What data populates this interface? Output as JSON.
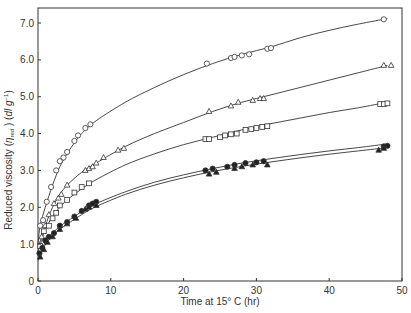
{
  "chart_data": {
    "type": "scatter",
    "title": "",
    "xlabel": "Time at 15° C (hr)",
    "ylabel": "Reduced viscosity (η red ) (dl g⁻¹)",
    "ylabel_parts": {
      "pre": "Reduced viscosity (",
      "eta": "η",
      "sub": "red",
      "post": " ) (",
      "unit": "dl g",
      "sup": "−1",
      "end": ")"
    },
    "xlim": [
      0,
      50
    ],
    "ylim": [
      0,
      7.4
    ],
    "x_ticks": [
      0,
      10,
      20,
      30,
      40,
      50
    ],
    "x_tick_labels": [
      "0",
      "10",
      "20",
      "30",
      "40",
      "50"
    ],
    "y_ticks": [
      0,
      1,
      2,
      3,
      4,
      5,
      6,
      7
    ],
    "y_tick_labels": [
      "0",
      "1.0",
      "2.0",
      "3.0",
      "4.0",
      "5.0",
      "6.0",
      "7.0"
    ],
    "grid": false,
    "legend": null,
    "series": [
      {
        "name": "open circles",
        "marker": "circle-open",
        "x": [
          0.3,
          0.7,
          1.2,
          1.8,
          2.5,
          3.0,
          3.5,
          4.0,
          5.0,
          5.5,
          6.5,
          7.2,
          23.2,
          26.5,
          27.0,
          28.0,
          29.0,
          31.5,
          32.0,
          47.5
        ],
        "y": [
          1.5,
          1.65,
          2.15,
          2.55,
          3.0,
          3.25,
          3.35,
          3.5,
          3.8,
          3.95,
          4.15,
          4.25,
          5.9,
          6.05,
          6.08,
          6.12,
          6.15,
          6.3,
          6.32,
          7.1
        ],
        "curve": [
          [
            0,
            1.0
          ],
          [
            0.3,
            1.5
          ],
          [
            1,
            2.0
          ],
          [
            2,
            2.6
          ],
          [
            3,
            3.1
          ],
          [
            4,
            3.45
          ],
          [
            5,
            3.75
          ],
          [
            6,
            4.0
          ],
          [
            8,
            4.35
          ],
          [
            12,
            4.85
          ],
          [
            16,
            5.25
          ],
          [
            20,
            5.6
          ],
          [
            24,
            5.9
          ],
          [
            28,
            6.15
          ],
          [
            32,
            6.35
          ],
          [
            36,
            6.6
          ],
          [
            40,
            6.8
          ],
          [
            44,
            6.97
          ],
          [
            48,
            7.12
          ]
        ]
      },
      {
        "name": "open triangles",
        "marker": "triangle-open",
        "x": [
          0.5,
          1.0,
          1.5,
          2.2,
          2.8,
          3.2,
          4.0,
          6.5,
          7.0,
          7.5,
          8.0,
          9.0,
          11.0,
          11.8,
          23.5,
          26.5,
          27.5,
          29.5,
          30.5,
          31.0,
          47.5,
          48.5
        ],
        "y": [
          1.2,
          1.5,
          1.8,
          2.1,
          2.25,
          2.35,
          2.6,
          3.0,
          3.05,
          3.1,
          3.2,
          3.35,
          3.55,
          3.6,
          4.6,
          4.75,
          4.85,
          4.9,
          4.95,
          4.95,
          5.85,
          5.85
        ],
        "curve": [
          [
            0,
            0.9
          ],
          [
            0.5,
            1.2
          ],
          [
            1,
            1.5
          ],
          [
            2,
            2.0
          ],
          [
            3,
            2.35
          ],
          [
            4,
            2.6
          ],
          [
            6,
            2.95
          ],
          [
            8,
            3.2
          ],
          [
            12,
            3.65
          ],
          [
            16,
            4.0
          ],
          [
            20,
            4.3
          ],
          [
            24,
            4.6
          ],
          [
            28,
            4.85
          ],
          [
            32,
            5.05
          ],
          [
            36,
            5.25
          ],
          [
            40,
            5.45
          ],
          [
            44,
            5.65
          ],
          [
            48,
            5.85
          ]
        ]
      },
      {
        "name": "open squares",
        "marker": "square-open",
        "x": [
          0.3,
          0.8,
          1.5,
          2.0,
          2.5,
          3.0,
          4.0,
          5.0,
          6.0,
          7.0,
          23.0,
          23.5,
          25.0,
          25.7,
          26.5,
          27.3,
          28.5,
          29.3,
          30.0,
          30.8,
          31.5,
          47.0,
          47.5,
          48.0
        ],
        "y": [
          0.95,
          1.35,
          1.5,
          1.7,
          1.85,
          2.05,
          2.2,
          2.4,
          2.55,
          2.65,
          3.85,
          3.85,
          3.9,
          3.95,
          3.98,
          4.0,
          4.1,
          4.12,
          4.15,
          4.18,
          4.2,
          4.8,
          4.8,
          4.82
        ],
        "curve": [
          [
            0,
            0.8
          ],
          [
            0.5,
            1.1
          ],
          [
            1,
            1.4
          ],
          [
            2,
            1.75
          ],
          [
            3,
            2.0
          ],
          [
            4,
            2.2
          ],
          [
            6,
            2.5
          ],
          [
            8,
            2.75
          ],
          [
            12,
            3.15
          ],
          [
            16,
            3.45
          ],
          [
            20,
            3.7
          ],
          [
            24,
            3.9
          ],
          [
            28,
            4.1
          ],
          [
            32,
            4.27
          ],
          [
            36,
            4.42
          ],
          [
            40,
            4.57
          ],
          [
            44,
            4.7
          ],
          [
            48,
            4.85
          ]
        ]
      },
      {
        "name": "filled circles",
        "marker": "circle-filled",
        "x": [
          0.2,
          0.6,
          1.0,
          1.5,
          2.2,
          3.0,
          4.0,
          5.0,
          6.0,
          7.0,
          7.5,
          8.0,
          23.0,
          24.0,
          26.0,
          27.0,
          28.5,
          30.0,
          31.0,
          47.5,
          48.0
        ],
        "y": [
          0.75,
          0.9,
          1.1,
          1.2,
          1.3,
          1.5,
          1.6,
          1.75,
          1.9,
          2.05,
          2.1,
          2.15,
          3.0,
          3.05,
          3.1,
          3.15,
          3.2,
          3.22,
          3.25,
          3.65,
          3.67
        ],
        "curve": [
          [
            0,
            0.6
          ],
          [
            0.5,
            0.85
          ],
          [
            1,
            1.05
          ],
          [
            2,
            1.3
          ],
          [
            3,
            1.48
          ],
          [
            4,
            1.62
          ],
          [
            6,
            1.88
          ],
          [
            8,
            2.1
          ],
          [
            12,
            2.42
          ],
          [
            16,
            2.68
          ],
          [
            20,
            2.88
          ],
          [
            24,
            3.05
          ],
          [
            28,
            3.2
          ],
          [
            32,
            3.32
          ],
          [
            36,
            3.43
          ],
          [
            40,
            3.53
          ],
          [
            44,
            3.62
          ],
          [
            48,
            3.72
          ]
        ]
      },
      {
        "name": "filled triangles",
        "marker": "triangle-filled",
        "x": [
          0.3,
          0.8,
          1.3,
          2.0,
          3.0,
          4.0,
          5.2,
          6.5,
          7.0,
          8.0,
          23.5,
          24.5,
          27.0,
          28.0,
          29.5,
          31.5,
          46.8,
          47.5
        ],
        "y": [
          0.65,
          0.85,
          1.05,
          1.2,
          1.4,
          1.55,
          1.7,
          1.95,
          2.0,
          2.05,
          2.9,
          2.95,
          3.05,
          3.1,
          3.15,
          3.15,
          3.55,
          3.6
        ],
        "curve": [
          [
            0,
            0.55
          ],
          [
            0.5,
            0.8
          ],
          [
            1,
            0.98
          ],
          [
            2,
            1.22
          ],
          [
            3,
            1.4
          ],
          [
            4,
            1.54
          ],
          [
            6,
            1.8
          ],
          [
            8,
            2.02
          ],
          [
            12,
            2.35
          ],
          [
            16,
            2.6
          ],
          [
            20,
            2.8
          ],
          [
            24,
            2.97
          ],
          [
            28,
            3.11
          ],
          [
            32,
            3.23
          ],
          [
            36,
            3.34
          ],
          [
            40,
            3.44
          ],
          [
            44,
            3.53
          ],
          [
            48,
            3.62
          ]
        ]
      }
    ]
  }
}
